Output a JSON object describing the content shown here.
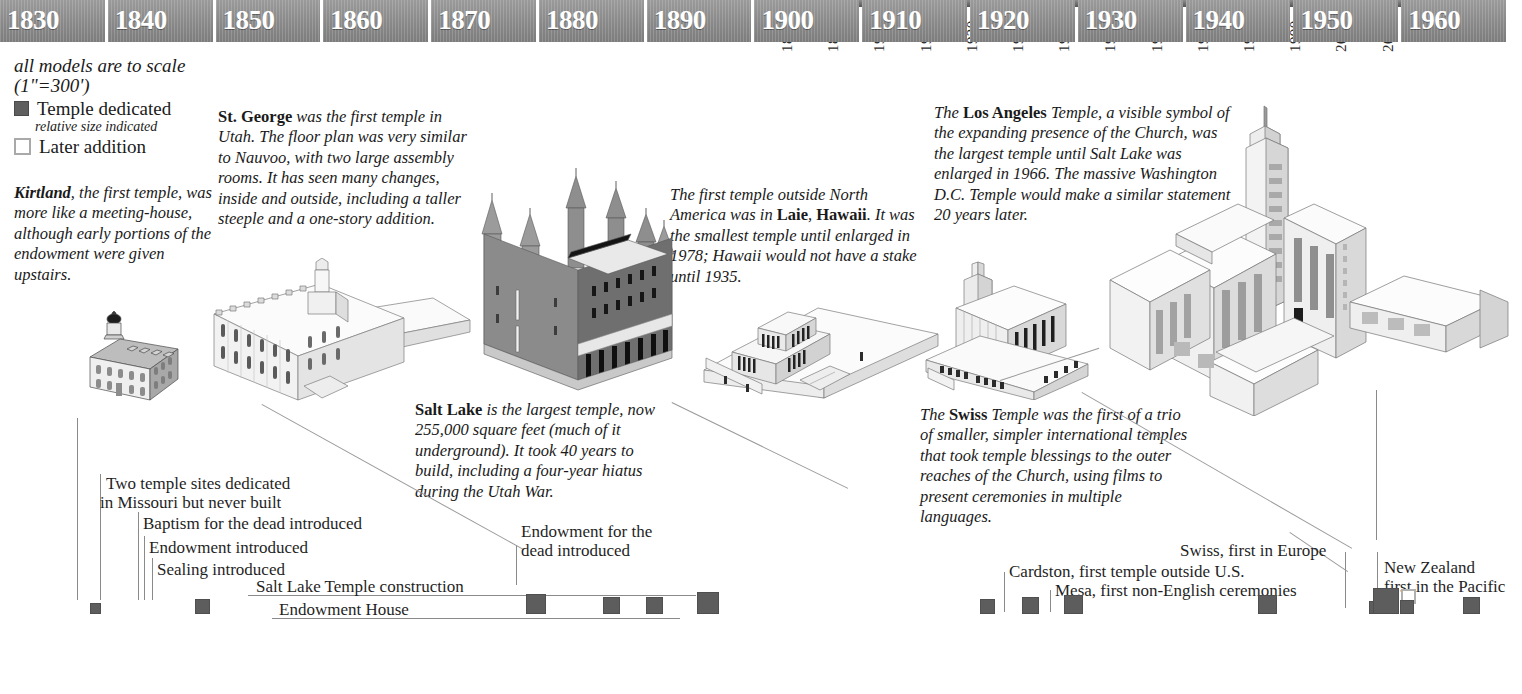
{
  "top_axis": {
    "ticks": [
      "1880",
      "1890",
      "1900",
      "1910",
      "1920",
      "1930",
      "1940",
      "1950",
      "1960",
      "1970",
      "1980",
      "1990",
      "2000",
      "2010"
    ],
    "corner_value": "0"
  },
  "legend": {
    "scale_note": "all models are to scale (1\"=300')",
    "scale_note_line1": "all models are to scale",
    "scale_note_line2": "(1\"=300')",
    "dedicated_label": "Temple dedicated",
    "dedicated_sub": "relative size indicated",
    "later_label": "Later addition",
    "filled_color": "#5f5f5f",
    "open_color": "#a9a9a9"
  },
  "notes": {
    "kirtland": {
      "lead": "Kirtland",
      "body": ", the first temple, was more like a meeting-house, although early portions of the endowment were given upstairs."
    },
    "st_george": {
      "lead": "St. George",
      "body": " was the first temple in Utah. The floor plan was very similar to Nauvoo, with two large assembly rooms.  It has seen many changes, inside and outside, including a taller steeple and a one-story addition."
    },
    "salt_lake": {
      "lead": "Salt Lake",
      "body": " is the largest temple, now 255,000 square feet (much of it underground).  It took 40 years to build, including a four-year hiatus during the Utah War."
    },
    "laie": {
      "part1": "The first temple outside North America was in ",
      "bold1": "Laie",
      "part2": ", ",
      "bold2": "Hawaii",
      "part3": ". It was the smallest temple until enlarged in 1978; Hawaii would not have a stake until 1935."
    },
    "los_angeles": {
      "part1": "The ",
      "bold1": "Los Angeles",
      "part2": " Temple, a visible symbol of the expanding presence of the Church, was the largest temple until Salt Lake was enlarged in 1966. The massive Washington D.C. Temple would make a similar statement 20 years later."
    },
    "swiss": {
      "part1": "The ",
      "bold1": "Swiss",
      "part2": " Temple was the first of a trio of smaller, simpler international temples that took temple blessings to the outer reaches of the Church, using films to present ceremonies in multiple languages."
    }
  },
  "events": {
    "missouri_l1": "Two temple sites dedicated",
    "missouri_l2": "in Missouri but never built",
    "baptism": "Baptism for the dead introduced",
    "endowment": "Endowment introduced",
    "sealing": "Sealing introduced",
    "slc_construction": "Salt Lake Temple construction",
    "endowment_house": "Endowment House",
    "endowment_dead_l1": "Endowment for the",
    "endowment_dead_l2": "dead introduced",
    "swiss_europe": "Swiss, first in Europe",
    "cardston": "Cardston, first temple outside U.S.",
    "mesa": "Mesa, first non-English ceremonies",
    "new_zealand_l1": "New Zealand",
    "new_zealand_l2": "first in the Pacific"
  },
  "chart_data": {
    "type": "timeline",
    "xlabel": "",
    "ylabel": "",
    "xlim": [
      1828,
      1968
    ],
    "grid": false,
    "legend_position": "top-left",
    "decades": [
      "1830",
      "1840",
      "1850",
      "1860",
      "1870",
      "1880",
      "1890",
      "1900",
      "1910",
      "1920",
      "1930",
      "1940",
      "1950",
      "1960"
    ],
    "markers": [
      {
        "name": "Kirtland",
        "year": 1836,
        "kind": "dedicated",
        "size": 9
      },
      {
        "name": "Nauvoo",
        "year": 1846,
        "kind": "dedicated",
        "size": 13
      },
      {
        "name": "St. George",
        "year": 1877,
        "kind": "dedicated",
        "size": 18
      },
      {
        "name": "Logan",
        "year": 1884,
        "kind": "dedicated",
        "size": 15
      },
      {
        "name": "Manti",
        "year": 1888,
        "kind": "dedicated",
        "size": 15
      },
      {
        "name": "Salt Lake",
        "year": 1893,
        "kind": "dedicated",
        "size": 20
      },
      {
        "name": "Laie Hawaii",
        "year": 1919,
        "kind": "dedicated",
        "size": 13
      },
      {
        "name": "Cardston Alberta",
        "year": 1923,
        "kind": "dedicated",
        "size": 15
      },
      {
        "name": "Mesa Arizona",
        "year": 1927,
        "kind": "dedicated",
        "size": 17
      },
      {
        "name": "Idaho Falls",
        "year": 1945,
        "kind": "dedicated",
        "size": 17
      },
      {
        "name": "Bern Switzerland",
        "year": 1955,
        "kind": "dedicated",
        "size": 11
      },
      {
        "name": "Los Angeles",
        "year": 1956,
        "kind": "dedicated",
        "size": 24
      },
      {
        "name": "Hamilton New Zealand",
        "year": 1958,
        "kind": "later-addition",
        "size": 11
      },
      {
        "name": "London England",
        "year": 1958,
        "kind": "dedicated",
        "size": 12
      },
      {
        "name": "Oakland",
        "year": 1964,
        "kind": "dedicated",
        "size": 15
      }
    ],
    "spans": [
      {
        "name": "Salt Lake Temple construction",
        "start": 1853,
        "end": 1893
      },
      {
        "name": "Endowment House",
        "start": 1855,
        "end": 1889
      }
    ],
    "models": [
      "Kirtland",
      "St. George",
      "Salt Lake",
      "Laie Hawaii",
      "Bern Switzerland",
      "Los Angeles"
    ]
  }
}
